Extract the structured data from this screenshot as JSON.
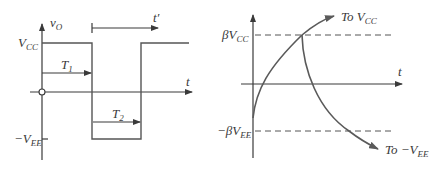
{
  "left_panel": {
    "y_axis_label": {
      "main": "v",
      "sub": "O"
    },
    "x_axis_label": "t",
    "vcc_label": {
      "main": "V",
      "sub": "CC"
    },
    "vee_label": {
      "prefix": "−",
      "main": "V",
      "sub": "EE"
    },
    "t1_label": {
      "main": "T",
      "sub": "1"
    },
    "t2_label": {
      "main": "T",
      "sub": "2"
    },
    "t_prime_label": "t′"
  },
  "right_panel": {
    "x_axis_label": "t",
    "beta_vcc_label": {
      "main": "βV",
      "sub": "CC"
    },
    "beta_vee_label": {
      "main": "−βV",
      "sub": "EE"
    },
    "to_vcc_label": {
      "main": "To V",
      "sub": "CC"
    },
    "to_vee_label": {
      "main": "To −V",
      "sub": "EE"
    }
  },
  "colors": {
    "line": "#3a3a3a",
    "curve": "#5a5a5a",
    "background": "#ffffff"
  }
}
